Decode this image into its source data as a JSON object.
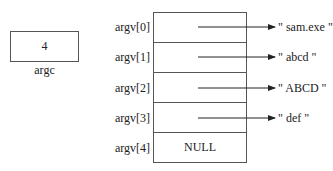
{
  "argc": {
    "value": "4",
    "label": "argc"
  },
  "argv": {
    "rows": [
      {
        "label": "argv[0]",
        "cell": "",
        "target": "\" sam.exe \""
      },
      {
        "label": "argv[1]",
        "cell": "",
        "target": "\" abcd \""
      },
      {
        "label": "argv[2]",
        "cell": "",
        "target": "\" ABCD \""
      },
      {
        "label": "argv[3]",
        "cell": "",
        "target": "\" def \""
      },
      {
        "label": "argv[4]",
        "cell": "NULL",
        "target": ""
      }
    ]
  },
  "arrows": [
    {
      "from_row": 0,
      "to": "\" sam.exe \"",
      "icon": "arrow-right-icon"
    },
    {
      "from_row": 1,
      "to": "\" abcd \"",
      "icon": "arrow-right-icon"
    },
    {
      "from_row": 2,
      "to": "\" ABCD \"",
      "icon": "arrow-right-icon"
    },
    {
      "from_row": 3,
      "to": "\" def \"",
      "icon": "arrow-right-icon"
    }
  ]
}
